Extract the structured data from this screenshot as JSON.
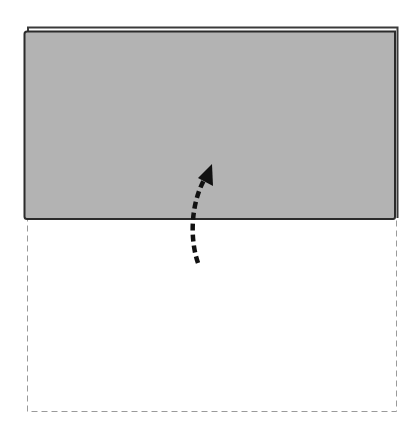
{
  "diagram": {
    "type": "paper-fold-instruction",
    "colors": {
      "background": "#ffffff",
      "paper_fill": "#b3b3b3",
      "paper_edge": "#2b2b2b",
      "back_sheet_edge": "#3a3a3a",
      "dashed_outline": "#9a9a9a",
      "arrow": "#111111"
    },
    "elements": {
      "folded_panel": {
        "label": "folded flap (gray)"
      },
      "back_sheet": {
        "label": "sheet edge behind flap"
      },
      "dashed_outline": {
        "label": "original unfolded position"
      },
      "arrow": {
        "label": "fold-up direction arrow",
        "icon": "curved-dashed-arrow-up"
      }
    }
  }
}
